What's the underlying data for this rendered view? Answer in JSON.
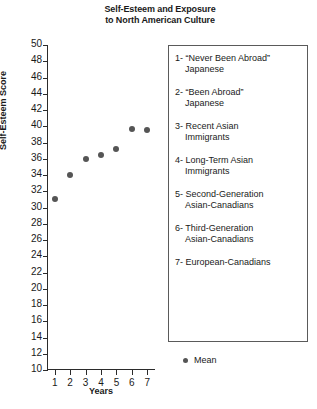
{
  "chart_data": {
    "type": "scatter",
    "title": "Self-Esteem and Exposure to North American Culture",
    "title_lines": [
      "Self-Esteem and Exposure",
      "to North American Culture"
    ],
    "xlabel": "Years",
    "ylabel": "Self-Esteem Score",
    "xlim": [
      0.5,
      7.5
    ],
    "ylim": [
      10,
      50
    ],
    "grid": false,
    "legend_position": "right",
    "x": [
      1,
      2,
      3,
      4,
      5,
      6,
      7
    ],
    "categories": [
      "1",
      "2",
      "3",
      "4",
      "5",
      "6",
      "7"
    ],
    "values": [
      31,
      34,
      36,
      36.5,
      37.2,
      39.7,
      39.6
    ],
    "series": [
      {
        "name": "Mean",
        "values": [
          31,
          34,
          36,
          36.5,
          37.2,
          39.7,
          39.6
        ]
      }
    ],
    "ytick_labels": [
      "50",
      "48",
      "46",
      "44",
      "42",
      "40",
      "38",
      "36",
      "34",
      "32",
      "30",
      "28",
      "26",
      "24",
      "22",
      "20",
      "18",
      "16",
      "14",
      "12",
      "10"
    ],
    "ytick_values": [
      50,
      48,
      46,
      44,
      42,
      40,
      38,
      36,
      34,
      32,
      30,
      28,
      26,
      24,
      22,
      20,
      18,
      16,
      14,
      12,
      10
    ],
    "xtick_labels": [
      "1",
      "2",
      "3",
      "4",
      "5",
      "6",
      "7"
    ],
    "marker_color": "#555555",
    "axis_color": "#2b2b2b"
  },
  "legend": {
    "items": [
      {
        "line1": "1- “Never Been Abroad”",
        "line2": "Japanese"
      },
      {
        "line1": "2- “Been Abroad”",
        "line2": "Japanese"
      },
      {
        "line1": "3- Recent Asian",
        "line2": "Immigrants"
      },
      {
        "line1": "4- Long-Term Asian",
        "line2": "Immigrants"
      },
      {
        "line1": "5- Second-Generation",
        "line2": "Asian-Canadians"
      },
      {
        "line1": "6- Third-Generation",
        "line2": "Asian-Canadians"
      },
      {
        "line1": "7- European-Canadians",
        "line2": ""
      }
    ],
    "key_label": "Mean"
  }
}
